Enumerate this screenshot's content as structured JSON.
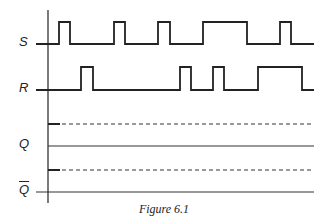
{
  "figure": {
    "caption": "Figure 6.1",
    "signals": [
      {
        "name": "S",
        "label": "S",
        "low_y": 44,
        "high_y": 22,
        "pulses": [
          [
            59,
            70
          ],
          [
            114,
            125
          ],
          [
            158,
            170
          ],
          [
            203,
            247
          ],
          [
            280,
            291
          ]
        ],
        "end_x": 314
      },
      {
        "name": "R",
        "label": "R",
        "low_y": 90,
        "high_y": 67,
        "pulses": [
          [
            81,
            93
          ],
          [
            180,
            191
          ],
          [
            213,
            224
          ],
          [
            258,
            302
          ]
        ],
        "end_x": 314
      }
    ],
    "outputs": [
      {
        "name": "Q",
        "label": "Q",
        "dashed_y": 124,
        "solid_y": 146
      },
      {
        "name": "Q-bar",
        "label": "Q",
        "overbar": true,
        "dashed_y": 170,
        "solid_y": 192
      }
    ],
    "axis": {
      "x": 48,
      "y_top": 10,
      "y_bottom": 203
    }
  }
}
